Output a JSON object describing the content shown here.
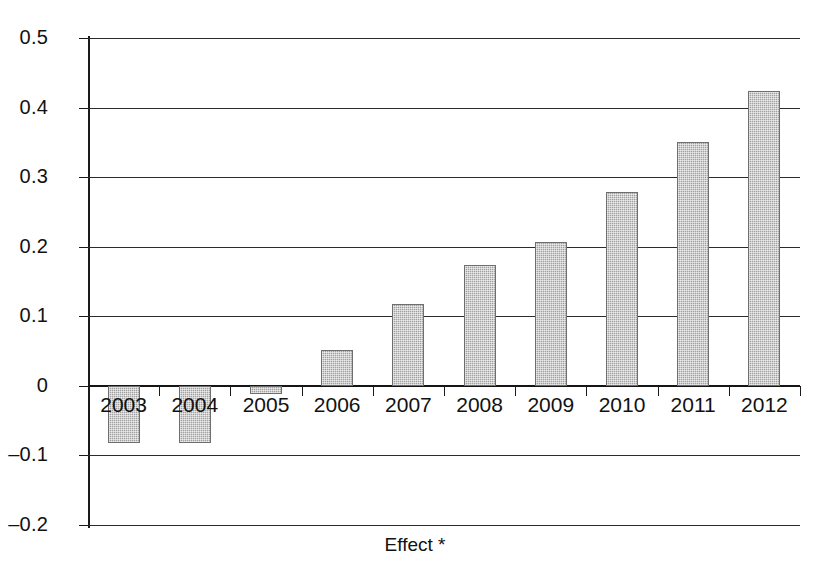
{
  "chart_data": {
    "type": "bar",
    "title": "",
    "subtitle": "",
    "xlabel": "Effect *",
    "ylabel": "",
    "categories": [
      "2003",
      "2004",
      "2005",
      "2006",
      "2007",
      "2008",
      "2009",
      "2010",
      "2011",
      "2012"
    ],
    "values": [
      -0.082,
      -0.082,
      -0.012,
      0.051,
      0.118,
      0.173,
      0.207,
      0.278,
      0.351,
      0.424
    ],
    "series": [
      {
        "name": "Effect *",
        "values": [
          -0.082,
          -0.082,
          -0.012,
          0.051,
          0.118,
          0.173,
          0.207,
          0.278,
          0.351,
          0.424
        ]
      }
    ],
    "ylim": [
      -0.2,
      0.5
    ],
    "ytick_labels": [
      "0.5",
      "0.4",
      "0.3",
      "0.2",
      "0.1",
      "0",
      "–0.1",
      "–0.2"
    ],
    "ytick_values": [
      0.5,
      0.4,
      0.3,
      0.2,
      0.1,
      0,
      -0.1,
      -0.2
    ],
    "grid": "horizontal",
    "legend": "none",
    "bar_color": "#a0a0a0",
    "bar_edge_color": "#6e6e6e",
    "axis_color": "#1a1a1a",
    "background_color": "#ffffff",
    "annotations": []
  }
}
